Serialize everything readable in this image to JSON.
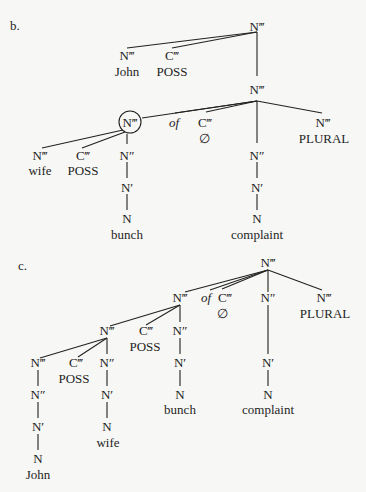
{
  "panels": [
    {
      "label": "b.",
      "nodes": {
        "root": "N‴",
        "john_np": "N‴",
        "john": "John",
        "poss1_c": "C‴",
        "poss1": "POSS",
        "mid": "N‴",
        "circled": "N‴",
        "wife_np": "N‴",
        "wife": "wife",
        "poss2_c": "C‴",
        "poss2": "POSS",
        "bunch_n2": "N″",
        "bunch_n1": "N′",
        "bunch_n0": "N",
        "bunch": "bunch",
        "of": "of",
        "c_empty": "C‴",
        "empty": "∅",
        "comp_n2": "N″",
        "comp_n1": "N′",
        "comp_n0": "N",
        "complaint": "complaint",
        "plural_np": "N‴",
        "plural": "PLURAL"
      }
    },
    {
      "label": "c.",
      "nodes": {
        "root": "N‴",
        "n_a": "N‴",
        "of": "of",
        "c_empty": "C‴",
        "empty": "∅",
        "comp_n2": "N″",
        "comp_n1": "N′",
        "comp_n0": "N",
        "complaint": "complaint",
        "plural_np": "N‴",
        "plural": "PLURAL",
        "n_b": "N‴",
        "poss1_c": "C‴",
        "poss1": "POSS",
        "bunch_n2": "N″",
        "bunch_n1": "N′",
        "bunch_n0": "N",
        "bunch": "bunch",
        "john_n3": "N‴",
        "john_n2": "N″",
        "john_n1": "N′",
        "john_n0": "N",
        "john": "John",
        "poss2_c": "C‴",
        "poss2": "POSS",
        "wife_n2": "N″",
        "wife_n1": "N′",
        "wife_n0": "N",
        "wife": "wife"
      }
    }
  ]
}
